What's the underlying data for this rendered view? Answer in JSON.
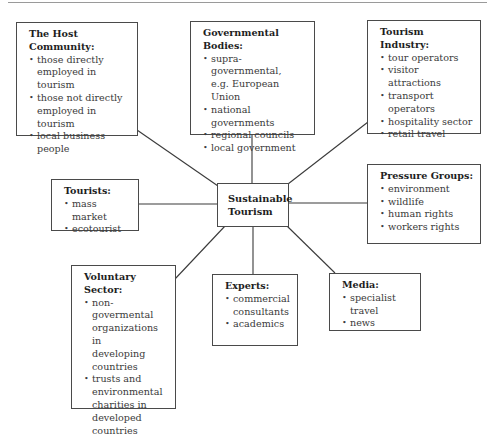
{
  "diagram": {
    "center": {
      "line1": "Sustainable",
      "line2": "Tourism"
    },
    "nodes": {
      "host_community": {
        "title_line1": "The Host",
        "title_line2": "Community:",
        "items": [
          [
            "those directly",
            "employed in tourism"
          ],
          [
            "those not directly",
            "employed in tourism"
          ],
          [
            "local business",
            "people"
          ]
        ]
      },
      "governmental_bodies": {
        "title_line1": "Governmental",
        "title_line2": "Bodies:",
        "items": [
          [
            "supra-governmental,",
            "e.g. European Union"
          ],
          [
            "national governments"
          ],
          [
            "regional councils"
          ],
          [
            "local government"
          ]
        ]
      },
      "tourism_industry": {
        "title_line1": "Tourism Industry:",
        "items": [
          [
            "tour operators"
          ],
          [
            "visitor attractions"
          ],
          [
            "transport operators"
          ],
          [
            "hospitality sector"
          ],
          [
            "retail travel"
          ]
        ]
      },
      "tourists": {
        "title_line1": "Tourists:",
        "items": [
          [
            "mass market"
          ],
          [
            "ecotourist"
          ]
        ]
      },
      "pressure_groups": {
        "title_line1": "Pressure Groups:",
        "items": [
          [
            "environment"
          ],
          [
            "wildlife"
          ],
          [
            "human rights"
          ],
          [
            "workers rights"
          ]
        ]
      },
      "voluntary_sector": {
        "title_line1": "Voluntary Sector:",
        "items": [
          [
            "non-govermental",
            "organizations in",
            "developing",
            "countries"
          ],
          [
            "trusts and",
            "environmental",
            "charities in",
            "developed",
            "countries"
          ]
        ]
      },
      "experts": {
        "title_line1": "Experts:",
        "items": [
          [
            "commercial",
            "consultants"
          ],
          [
            "academics"
          ]
        ]
      },
      "media": {
        "title_line1": "Media:",
        "items": [
          [
            "specialist travel"
          ],
          [
            "news"
          ]
        ]
      }
    },
    "bullet_glyph": "•",
    "colors": {
      "border": "#4a4a4a",
      "text": "#3a3a3a",
      "title": "#1e1e1e",
      "background": "#ffffff"
    }
  }
}
